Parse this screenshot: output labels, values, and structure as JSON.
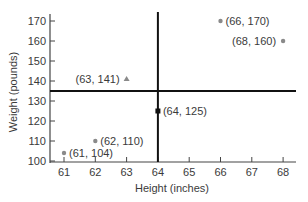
{
  "chart_data": {
    "type": "scatter",
    "title": "",
    "xlabel": "Height (inches)",
    "ylabel": "Weight (pounds)",
    "xlim": [
      60.5,
      68.5
    ],
    "ylim": [
      100,
      172
    ],
    "x_ticks": [
      61,
      62,
      63,
      64,
      65,
      66,
      67,
      68
    ],
    "y_ticks": [
      100,
      110,
      120,
      130,
      140,
      150,
      160,
      170
    ],
    "grid": false,
    "legend": null,
    "points": [
      {
        "x": 61,
        "y": 104,
        "label": "(61, 104)",
        "marker": "circle",
        "color": "#8a8a8a",
        "label_pos": "right"
      },
      {
        "x": 62,
        "y": 110,
        "label": "(62, 110)",
        "marker": "circle",
        "color": "#8a8a8a",
        "label_pos": "right"
      },
      {
        "x": 63,
        "y": 141,
        "label": "(63, 141)",
        "marker": "triangle",
        "color": "#8a8a8a",
        "label_pos": "left"
      },
      {
        "x": 64,
        "y": 125,
        "label": "(64, 125)",
        "marker": "square",
        "color": "#111111",
        "label_pos": "right"
      },
      {
        "x": 66,
        "y": 170,
        "label": "(66, 170)",
        "marker": "circle",
        "color": "#8a8a8a",
        "label_pos": "right"
      },
      {
        "x": 68,
        "y": 160,
        "label": "(68, 160)",
        "marker": "circle",
        "color": "#8a8a8a",
        "label_pos": "left"
      }
    ],
    "reference_lines": [
      {
        "orientation": "vertical",
        "x": 64,
        "color": "#111111"
      },
      {
        "orientation": "horizontal",
        "y": 135,
        "color": "#111111"
      }
    ]
  }
}
